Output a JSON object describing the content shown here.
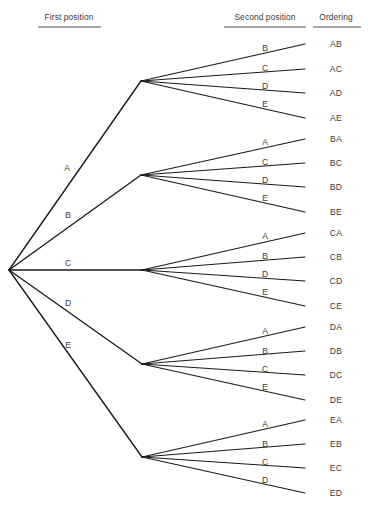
{
  "columns": [
    {
      "id": "first-position",
      "label": "First position",
      "x": 69,
      "text_y": 20,
      "rule_y": 27,
      "rule_x1": 38,
      "rule_x2": 101
    },
    {
      "id": "second-position",
      "label": "Second position",
      "x": 265,
      "text_y": 20,
      "rule_y": 27,
      "rule_x1": 224,
      "rule_x2": 306
    },
    {
      "id": "ordering",
      "label": "Ordering",
      "x": 336,
      "text_y": 20,
      "rule_y": 27,
      "rule_x1": 313,
      "rule_x2": 361
    }
  ],
  "colors": {
    "line": "#1a1a1a",
    "text": "#3b3a3c",
    "background": "#ffffff"
  },
  "root": {
    "x": 9,
    "y": 270
  },
  "chart_data": {
    "type": "tree",
    "title": "",
    "levels": [
      "First position",
      "Second position",
      "Ordering"
    ],
    "total_outcomes": 20,
    "first_choices": [
      "A",
      "B",
      "C",
      "D",
      "E"
    ],
    "second_choices_per_first": {
      "A": [
        "B",
        "C",
        "D",
        "E"
      ],
      "B": [
        "A",
        "C",
        "D",
        "E"
      ],
      "C": [
        "A",
        "B",
        "D",
        "E"
      ],
      "D": [
        "A",
        "B",
        "C",
        "E"
      ],
      "E": [
        "A",
        "B",
        "C",
        "D"
      ]
    },
    "outcomes": [
      "AB",
      "AC",
      "AD",
      "AE",
      "BA",
      "BC",
      "BD",
      "BE",
      "CA",
      "CB",
      "CD",
      "CE",
      "DA",
      "DB",
      "DC",
      "DE",
      "EA",
      "EB",
      "EC",
      "ED"
    ]
  },
  "branches": [
    {
      "id": "branch-a",
      "label": "A",
      "label_x": 67,
      "label_y": 171,
      "node_x": 141,
      "node_y": 81,
      "children": [
        {
          "label": "B",
          "label_x": 265,
          "label_y": 51,
          "end_x": 305,
          "end_y": 44,
          "outcome": "AB",
          "outcome_x": 336,
          "outcome_y": 47
        },
        {
          "label": "C",
          "label_x": 265,
          "label_y": 71,
          "end_x": 305,
          "end_y": 69,
          "outcome": "AC",
          "outcome_x": 336,
          "outcome_y": 72
        },
        {
          "label": "D",
          "label_x": 265,
          "label_y": 89,
          "end_x": 305,
          "end_y": 93,
          "outcome": "AD",
          "outcome_x": 336,
          "outcome_y": 96
        },
        {
          "label": "E",
          "label_x": 265,
          "label_y": 107,
          "end_x": 305,
          "end_y": 118,
          "outcome": "AE",
          "outcome_x": 336,
          "outcome_y": 121
        }
      ]
    },
    {
      "id": "branch-b",
      "label": "B",
      "label_x": 68,
      "label_y": 218,
      "node_x": 141,
      "node_y": 175,
      "children": [
        {
          "label": "A",
          "label_x": 265,
          "label_y": 145,
          "end_x": 305,
          "end_y": 139,
          "outcome": "BA",
          "outcome_x": 336,
          "outcome_y": 142
        },
        {
          "label": "C",
          "label_x": 265,
          "label_y": 165,
          "end_x": 305,
          "end_y": 163,
          "outcome": "BC",
          "outcome_x": 336,
          "outcome_y": 166
        },
        {
          "label": "D",
          "label_x": 265,
          "label_y": 183,
          "end_x": 305,
          "end_y": 187,
          "outcome": "BD",
          "outcome_x": 336,
          "outcome_y": 190
        },
        {
          "label": "E",
          "label_x": 265,
          "label_y": 201,
          "end_x": 305,
          "end_y": 212,
          "outcome": "BE",
          "outcome_x": 336,
          "outcome_y": 215
        }
      ]
    },
    {
      "id": "branch-c",
      "label": "C",
      "label_x": 68,
      "label_y": 266,
      "node_x": 142,
      "node_y": 270,
      "children": [
        {
          "label": "A",
          "label_x": 265,
          "label_y": 239,
          "end_x": 305,
          "end_y": 233,
          "outcome": "CA",
          "outcome_x": 336,
          "outcome_y": 236
        },
        {
          "label": "B",
          "label_x": 265,
          "label_y": 259,
          "end_x": 305,
          "end_y": 257,
          "outcome": "CB",
          "outcome_x": 336,
          "outcome_y": 260
        },
        {
          "label": "D",
          "label_x": 265,
          "label_y": 277,
          "end_x": 305,
          "end_y": 281,
          "outcome": "CD",
          "outcome_x": 336,
          "outcome_y": 284
        },
        {
          "label": "E",
          "label_x": 265,
          "label_y": 295,
          "end_x": 305,
          "end_y": 306,
          "outcome": "CE",
          "outcome_x": 336,
          "outcome_y": 309
        }
      ]
    },
    {
      "id": "branch-d",
      "label": "D",
      "label_x": 68,
      "label_y": 306,
      "node_x": 142,
      "node_y": 364,
      "children": [
        {
          "label": "A",
          "label_x": 265,
          "label_y": 334,
          "end_x": 305,
          "end_y": 327,
          "outcome": "DA",
          "outcome_x": 336,
          "outcome_y": 330
        },
        {
          "label": "B",
          "label_x": 265,
          "label_y": 354,
          "end_x": 305,
          "end_y": 351,
          "outcome": "DB",
          "outcome_x": 336,
          "outcome_y": 354
        },
        {
          "label": "C",
          "label_x": 265,
          "label_y": 372,
          "end_x": 305,
          "end_y": 375,
          "outcome": "DC",
          "outcome_x": 336,
          "outcome_y": 378
        },
        {
          "label": "E",
          "label_x": 265,
          "label_y": 390,
          "end_x": 305,
          "end_y": 400,
          "outcome": "DE",
          "outcome_x": 336,
          "outcome_y": 403
        }
      ]
    },
    {
      "id": "branch-e",
      "label": "E",
      "label_x": 68,
      "label_y": 348,
      "node_x": 142,
      "node_y": 457,
      "children": [
        {
          "label": "A",
          "label_x": 265,
          "label_y": 427,
          "end_x": 305,
          "end_y": 420,
          "outcome": "EA",
          "outcome_x": 336,
          "outcome_y": 423
        },
        {
          "label": "B",
          "label_x": 265,
          "label_y": 447,
          "end_x": 305,
          "end_y": 444,
          "outcome": "EB",
          "outcome_x": 336,
          "outcome_y": 447
        },
        {
          "label": "C",
          "label_x": 265,
          "label_y": 465,
          "end_x": 305,
          "end_y": 468,
          "outcome": "EC",
          "outcome_x": 336,
          "outcome_y": 471
        },
        {
          "label": "D",
          "label_x": 265,
          "label_y": 483,
          "end_x": 305,
          "end_y": 493,
          "outcome": "ED",
          "outcome_x": 336,
          "outcome_y": 496
        }
      ]
    }
  ]
}
